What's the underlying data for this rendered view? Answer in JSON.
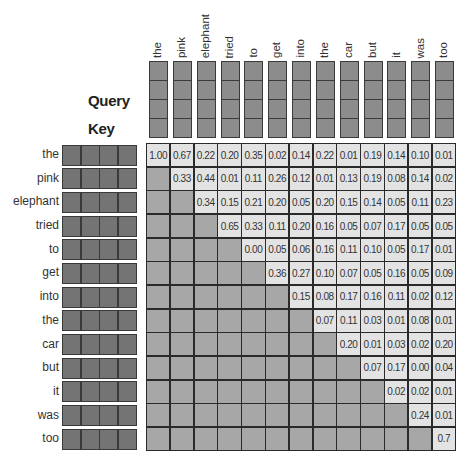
{
  "query": {
    "title": "Query",
    "tokens": [
      "the",
      "pink",
      "elephant",
      "tried",
      "to",
      "get",
      "into",
      "the",
      "car",
      "but",
      "it",
      "was",
      "too"
    ],
    "cells_per_token": 4
  },
  "key": {
    "title": "Key",
    "tokens": [
      "the",
      "pink",
      "elephant",
      "tried",
      "to",
      "get",
      "into",
      "the",
      "car",
      "but",
      "it",
      "was",
      "too"
    ],
    "cells_per_token": 4
  },
  "attention_matrix": {
    "masked_color": "#a7a7a7",
    "value_color": "#e3e3e3",
    "rows": [
      [
        "1.00",
        "0.67",
        "0.22",
        "0.20",
        "0.35",
        "0.02",
        "0.14",
        "0.22",
        "0.01",
        "0.19",
        "0.14",
        "0.10",
        "0.01"
      ],
      [
        null,
        "0.33",
        "0.44",
        "0.01",
        "0.11",
        "0.26",
        "0.12",
        "0.01",
        "0.13",
        "0.19",
        "0.08",
        "0.14",
        "0.02"
      ],
      [
        null,
        null,
        "0.34",
        "0.15",
        "0.21",
        "0.20",
        "0.05",
        "0.20",
        "0.15",
        "0.14",
        "0.05",
        "0.11",
        "0.23"
      ],
      [
        null,
        null,
        null,
        "0.65",
        "0.33",
        "0.11",
        "0.20",
        "0.16",
        "0.05",
        "0.07",
        "0.17",
        "0.05",
        "0.05"
      ],
      [
        null,
        null,
        null,
        null,
        "0.00",
        "0.05",
        "0.06",
        "0.16",
        "0.11",
        "0.10",
        "0.05",
        "0.17",
        "0.01"
      ],
      [
        null,
        null,
        null,
        null,
        null,
        "0.36",
        "0.27",
        "0.10",
        "0.07",
        "0.05",
        "0.16",
        "0.05",
        "0.09"
      ],
      [
        null,
        null,
        null,
        null,
        null,
        null,
        "0.15",
        "0.08",
        "0.17",
        "0.16",
        "0.11",
        "0.02",
        "0.12"
      ],
      [
        null,
        null,
        null,
        null,
        null,
        null,
        null,
        "0.07",
        "0.11",
        "0.03",
        "0.01",
        "0.08",
        "0.01"
      ],
      [
        null,
        null,
        null,
        null,
        null,
        null,
        null,
        null,
        "0.20",
        "0.01",
        "0.03",
        "0.02",
        "0.20"
      ],
      [
        null,
        null,
        null,
        null,
        null,
        null,
        null,
        null,
        null,
        "0.07",
        "0.17",
        "0.00",
        "0.04"
      ],
      [
        null,
        null,
        null,
        null,
        null,
        null,
        null,
        null,
        null,
        null,
        "0.02",
        "0.02",
        "0.01"
      ],
      [
        null,
        null,
        null,
        null,
        null,
        null,
        null,
        null,
        null,
        null,
        null,
        "0.24",
        "0.01"
      ],
      [
        null,
        null,
        null,
        null,
        null,
        null,
        null,
        null,
        null,
        null,
        null,
        null,
        "0.7"
      ]
    ]
  }
}
